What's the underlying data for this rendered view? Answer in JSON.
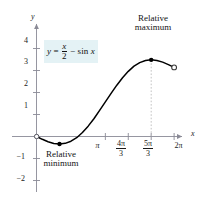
{
  "figure": {
    "background_color": "#ffffff",
    "curve_color": "#000000",
    "axis_color": "#8a8a96",
    "tick_label_color": "#1a1a1a",
    "equation_highlight_color": "#e4f2f5"
  },
  "equation": {
    "y": "y",
    "equals": "=",
    "numerator": "x",
    "denominator": "2",
    "minus": "−",
    "sin": "sin",
    "sin_arg": "x",
    "plain": "y = x/2 − sin x"
  },
  "axes": {
    "x_label": "x",
    "y_label": "y",
    "x_ticks": [
      {
        "label": "π",
        "type": "plain",
        "value": 3.1416
      },
      {
        "label": "4π/3",
        "type": "fraction",
        "num": "4π",
        "den": "3",
        "value": 4.1888
      },
      {
        "label": "5π/3",
        "type": "fraction",
        "num": "5π",
        "den": "3",
        "value": 5.236
      },
      {
        "label": "2π",
        "type": "plain",
        "value": 6.2832
      }
    ],
    "y_ticks": [
      {
        "label": "4",
        "value": 4
      },
      {
        "label": "3",
        "value": 3
      },
      {
        "label": "2",
        "value": 2
      },
      {
        "label": "1",
        "value": 1
      },
      {
        "label": "−1",
        "value": -1
      },
      {
        "label": "−2",
        "value": -2
      }
    ]
  },
  "annotations": {
    "maximum": {
      "line1": "Relative",
      "line2": "maximum"
    },
    "minimum": {
      "line1": "Relative",
      "line2": "minimum"
    }
  },
  "chart_data": {
    "type": "line",
    "title": "",
    "subtitle": "",
    "xlabel": "x",
    "ylabel": "y",
    "xlim": [
      -0.45,
      7.0
    ],
    "ylim": [
      -2.6,
      4.7
    ],
    "grid": false,
    "legend": null,
    "function": "y = x/2 - sin(x)",
    "domain": [
      0,
      6.2832
    ],
    "series": [
      {
        "name": "y = x/2 - sin x",
        "color": "#000000",
        "x": [
          0.0,
          0.2618,
          0.5236,
          0.7854,
          1.0472,
          1.309,
          1.5708,
          1.8326,
          2.0944,
          2.3562,
          2.618,
          2.8798,
          3.1416,
          3.4034,
          3.6652,
          3.927,
          4.1888,
          4.4506,
          4.7124,
          4.9742,
          5.236,
          5.4978,
          5.7596,
          6.0214,
          6.2832
        ],
        "y": [
          0.0,
          -0.1279,
          -0.2382,
          -0.3145,
          -0.3424,
          -0.3121,
          -0.2146,
          -0.0546,
          0.1806,
          0.471,
          0.809,
          1.1846,
          1.5708,
          1.957,
          2.3326,
          2.6706,
          2.961,
          3.1962,
          3.3562,
          3.4537,
          3.484,
          3.4561,
          3.3798,
          3.2695,
          3.1416
        ]
      }
    ],
    "points": [
      {
        "name": "relative-minimum",
        "x": 1.0472,
        "y": -0.3424,
        "x_label": "π/3",
        "marker": "filled-dot",
        "label": "Relative minimum"
      },
      {
        "name": "relative-maximum",
        "x": 5.236,
        "y": 3.484,
        "x_label": "5π/3",
        "marker": "filled-dot",
        "label": "Relative maximum"
      },
      {
        "name": "left-endpoint",
        "x": 0.0,
        "y": 0.0,
        "x_label": "0",
        "marker": "open-circle",
        "label": ""
      },
      {
        "name": "right-endpoint",
        "x": 6.2832,
        "y": 3.1416,
        "x_label": "2π",
        "marker": "open-circle",
        "label": ""
      }
    ],
    "reference_lines": [
      {
        "name": "max-dropline",
        "orientation": "vertical",
        "x": 5.236,
        "from_y": 0.0,
        "to_y": 3.484,
        "style": "dashed",
        "color": "#bdbdbd"
      }
    ]
  }
}
